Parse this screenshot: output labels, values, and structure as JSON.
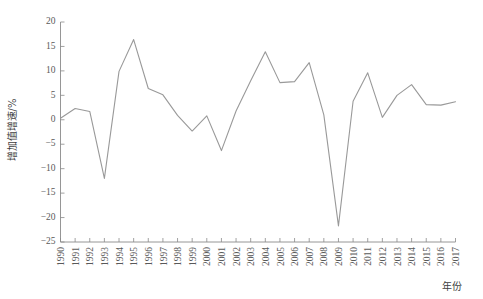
{
  "chart_data": {
    "type": "line",
    "title": "",
    "xlabel": "年份",
    "ylabel": "增加值增速/%",
    "xlim": [
      1990,
      2017
    ],
    "ylim": [
      -25,
      20
    ],
    "ytick_step": 5,
    "grid": false,
    "legend": null,
    "legend_position": "none",
    "line_color": "#999999",
    "categories": [
      "1990",
      "1991",
      "1992",
      "1993",
      "1994",
      "1995",
      "1996",
      "1997",
      "1998",
      "1999",
      "2000",
      "2001",
      "2002",
      "2003",
      "2004",
      "2005",
      "2006",
      "2007",
      "2008",
      "2009",
      "2010",
      "2011",
      "2012",
      "2013",
      "2014",
      "2015",
      "2016",
      "2017"
    ],
    "values": [
      0.3,
      2.3,
      1.7,
      -12.0,
      9.9,
      16.4,
      6.4,
      5.1,
      0.9,
      -2.3,
      0.8,
      -6.3,
      1.8,
      8.0,
      13.9,
      7.6,
      7.8,
      11.7,
      1.0,
      -21.7,
      3.8,
      9.6,
      0.5,
      5.0,
      7.2,
      3.1,
      3.0,
      3.7
    ],
    "ytick_labels": [
      "20",
      "15",
      "10",
      "5",
      "0",
      "−5",
      "−10",
      "−15",
      "−20",
      "−25"
    ],
    "ytick_values": [
      20,
      15,
      10,
      5,
      0,
      -5,
      -10,
      -15,
      -20,
      -25
    ]
  }
}
